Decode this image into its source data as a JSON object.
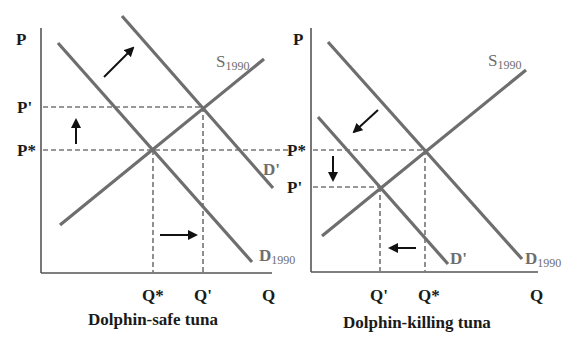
{
  "left_graph": {
    "title": "Dolphin-safe tuna",
    "y_axis_label": "P",
    "x_axis_label": "Q",
    "price_labels": [
      "P'",
      "P*"
    ],
    "quantity_labels": [
      "Q*",
      "Q'"
    ],
    "curves": {
      "supply": {
        "letter": "S",
        "sub": "1990"
      },
      "demand_original": {
        "letter": "D",
        "sub": "1990"
      },
      "demand_shifted": {
        "letter": "D'"
      }
    },
    "shift_direction": "demand increases (shift right/up)"
  },
  "right_graph": {
    "title": "Dolphin-killing tuna",
    "y_axis_label": "P",
    "x_axis_label": "Q",
    "price_labels": [
      "P*",
      "P'"
    ],
    "quantity_labels": [
      "Q'",
      "Q*"
    ],
    "curves": {
      "supply": {
        "letter": "S",
        "sub": "1990"
      },
      "demand_original": {
        "letter": "D",
        "sub": "1990"
      },
      "demand_shifted": {
        "letter": "D'"
      }
    },
    "shift_direction": "demand decreases (shift left/down)"
  },
  "colors": {
    "curve": "#6e6e6e",
    "axis": "#555555",
    "text": "#1a1a1a",
    "background": "#ffffff"
  }
}
